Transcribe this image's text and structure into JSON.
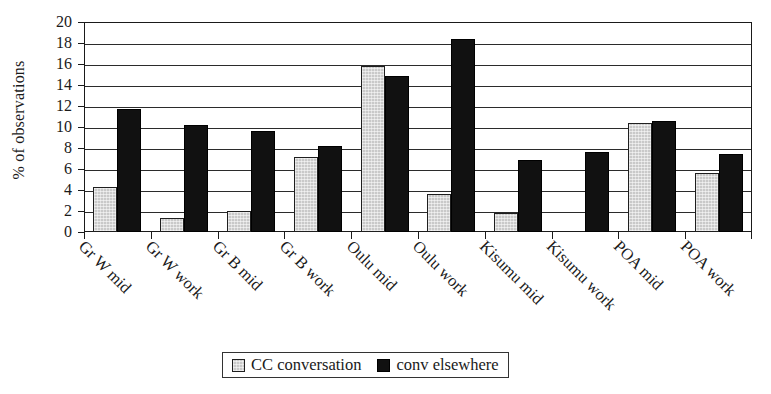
{
  "chart_data": {
    "type": "bar",
    "title": "",
    "xlabel": "",
    "ylabel": "% of observations",
    "ylim": [
      0,
      20
    ],
    "ytick_step": 2,
    "yticks": [
      0,
      2,
      4,
      6,
      8,
      10,
      12,
      14,
      16,
      18,
      20
    ],
    "grid": true,
    "grid_axis": "y",
    "legend_position": "bottom-center",
    "categories": [
      "Gr W mid",
      "Gr W work",
      "Gr B mid",
      "Gr B work",
      "Oulu mid",
      "Oulu work",
      "Kisumu mid",
      "Kisumu work",
      "POA mid",
      "POA work"
    ],
    "series": [
      {
        "name": "CC conversation",
        "color": "#c9c9c9",
        "values": [
          4.3,
          1.3,
          2.0,
          7.1,
          15.8,
          3.6,
          1.8,
          0,
          10.4,
          5.6
        ]
      },
      {
        "name": "conv elsewhere",
        "color": "#111111",
        "values": [
          11.7,
          10.2,
          9.6,
          8.2,
          14.9,
          18.4,
          6.9,
          7.6,
          10.6,
          7.4
        ]
      }
    ]
  },
  "axis": {
    "y_title": "% of observations",
    "y_tick_labels": [
      "0",
      "2",
      "4",
      "6",
      "8",
      "10",
      "12",
      "14",
      "16",
      "18",
      "20"
    ]
  },
  "legend": {
    "items": [
      {
        "label": "CC conversation",
        "swatch": "light"
      },
      {
        "label": "conv elsewhere",
        "swatch": "dark"
      }
    ]
  }
}
